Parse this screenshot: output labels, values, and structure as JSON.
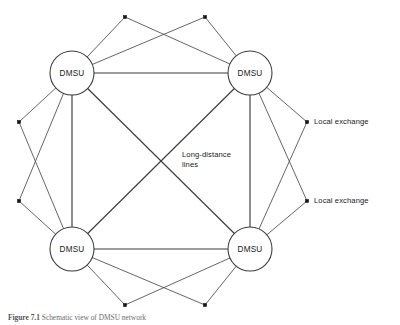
{
  "figure": {
    "caption_label": "Figure",
    "caption_number": "7.1",
    "caption_text": "Schematic view of DMSU network"
  },
  "labels": {
    "long_distance_line1": "Long-distance",
    "long_distance_line2": "lines",
    "local_exchange_top": "Local exchange",
    "local_exchange_bottom": "Local exchange"
  },
  "colors": {
    "background": "#ffffff",
    "line": "#3c3c3c",
    "access_line": "#4a4a4a",
    "node_stroke": "#3c3c3c",
    "node_fill": "#ffffff",
    "dot": "#151515",
    "text": "#1a1a1a",
    "caption_text": "#6d6d6d"
  },
  "diagram_data": {
    "type": "network-topology",
    "description": "Fully meshed DMSU core network with local exchanges attached to pairs of DMSUs",
    "canvas": {
      "width": 400,
      "height": 325
    },
    "node_radius": 22,
    "dot_size": 3.2,
    "nodes": [
      {
        "id": "dmsu-top-left",
        "label": "DMSU",
        "x": 72,
        "y": 73
      },
      {
        "id": "dmsu-top-right",
        "label": "DMSU",
        "x": 250,
        "y": 73
      },
      {
        "id": "dmsu-bottom-left",
        "label": "DMSU",
        "x": 72,
        "y": 249
      },
      {
        "id": "dmsu-bottom-right",
        "label": "DMSU",
        "x": 250,
        "y": 249
      }
    ],
    "exchanges": [
      {
        "id": "ex-top-left",
        "x": 125,
        "y": 17,
        "connects": [
          "dmsu-top-left",
          "dmsu-top-right"
        ]
      },
      {
        "id": "ex-top-right",
        "x": 205,
        "y": 17,
        "connects": [
          "dmsu-top-left",
          "dmsu-top-right"
        ]
      },
      {
        "id": "ex-left-upper",
        "x": 19,
        "y": 122,
        "connects": [
          "dmsu-top-left",
          "dmsu-bottom-left"
        ]
      },
      {
        "id": "ex-left-lower",
        "x": 19,
        "y": 201,
        "connects": [
          "dmsu-top-left",
          "dmsu-bottom-left"
        ]
      },
      {
        "id": "ex-right-upper",
        "x": 307,
        "y": 122,
        "connects": [
          "dmsu-top-right",
          "dmsu-bottom-right"
        ]
      },
      {
        "id": "ex-right-lower",
        "x": 307,
        "y": 201,
        "connects": [
          "dmsu-top-right",
          "dmsu-bottom-right"
        ]
      },
      {
        "id": "ex-bottom-left",
        "x": 125,
        "y": 305,
        "connects": [
          "dmsu-bottom-left",
          "dmsu-bottom-right"
        ]
      },
      {
        "id": "ex-bottom-right",
        "x": 205,
        "y": 305,
        "connects": [
          "dmsu-bottom-left",
          "dmsu-bottom-right"
        ]
      }
    ],
    "trunk_links": [
      {
        "from": "dmsu-top-left",
        "to": "dmsu-top-right",
        "kind": "side"
      },
      {
        "from": "dmsu-bottom-left",
        "to": "dmsu-bottom-right",
        "kind": "side"
      },
      {
        "from": "dmsu-top-left",
        "to": "dmsu-bottom-left",
        "kind": "side"
      },
      {
        "from": "dmsu-top-right",
        "to": "dmsu-bottom-right",
        "kind": "side"
      },
      {
        "from": "dmsu-top-left",
        "to": "dmsu-bottom-right",
        "kind": "diagonal"
      },
      {
        "from": "dmsu-top-right",
        "to": "dmsu-bottom-left",
        "kind": "diagonal"
      }
    ]
  }
}
